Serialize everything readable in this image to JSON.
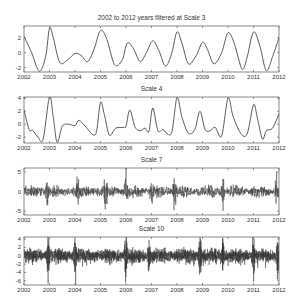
{
  "figure": {
    "width": 301,
    "height": 306,
    "line_color": "#333333",
    "axes_color": "#555555",
    "background": "#ffffff"
  },
  "chart_data": [
    {
      "type": "line",
      "title": "2002 to 2012 years filtered at Scale 3",
      "xlabel": "",
      "ylabel": "",
      "xlim": [
        2002,
        2012
      ],
      "ylim": [
        -2.6,
        3.6
      ],
      "xticks": [
        "2002",
        "2003",
        "2004",
        "2005",
        "2006",
        "2007",
        "2008",
        "2009",
        "2010",
        "2011",
        "2012"
      ],
      "yticks": [
        -2,
        0,
        2
      ],
      "box": {
        "x": 24,
        "y": 26,
        "w": 255,
        "h": 46
      },
      "title_y": 20,
      "style": "smooth",
      "series": [
        {
          "name": "Scale 3",
          "x": [
            2002.0,
            2002.3,
            2002.6,
            2002.85,
            2003.0,
            2003.15,
            2003.4,
            2003.7,
            2004.0,
            2004.25,
            2004.5,
            2004.75,
            2005.0,
            2005.25,
            2005.55,
            2005.85,
            2006.05,
            2006.3,
            2006.55,
            2006.8,
            2007.05,
            2007.3,
            2007.55,
            2007.8,
            2008.0,
            2008.2,
            2008.45,
            2008.75,
            2009.0,
            2009.2,
            2009.45,
            2009.75,
            2010.0,
            2010.25,
            2010.55,
            2010.75,
            2011.0,
            2011.25,
            2011.5,
            2011.75,
            2012.0
          ],
          "values": [
            2.2,
            0.0,
            -2.5,
            -0.5,
            3.3,
            2.0,
            -1.3,
            -1.0,
            -0.1,
            -0.4,
            -1.2,
            0.5,
            3.0,
            1.8,
            -1.6,
            -1.0,
            1.3,
            0.5,
            -1.2,
            0.0,
            1.6,
            0.2,
            -1.8,
            0.0,
            2.8,
            1.2,
            -1.5,
            -0.4,
            1.4,
            0.4,
            -1.5,
            0.0,
            2.7,
            1.2,
            -2.2,
            -0.6,
            2.8,
            0.9,
            -2.4,
            -0.5,
            2.0
          ]
        }
      ]
    },
    {
      "type": "line",
      "title": "Scale 4",
      "xlabel": "",
      "ylabel": "",
      "xlim": [
        2002,
        2012
      ],
      "ylim": [
        -2.9,
        4.2
      ],
      "xticks": [
        "2002",
        "2003",
        "2004",
        "2005",
        "2006",
        "2007",
        "2008",
        "2009",
        "2010",
        "2011",
        "2012"
      ],
      "yticks": [
        -2,
        0,
        2,
        4
      ],
      "box": {
        "x": 24,
        "y": 97,
        "w": 255,
        "h": 46
      },
      "title_y": 91,
      "style": "smooth",
      "series": [
        {
          "name": "Scale 4",
          "x": [
            2002.0,
            2002.2,
            2002.35,
            2002.55,
            2002.75,
            2003.0,
            2003.15,
            2003.3,
            2003.5,
            2003.75,
            2004.0,
            2004.15,
            2004.4,
            2004.7,
            2004.85,
            2005.0,
            2005.15,
            2005.35,
            2005.6,
            2005.9,
            2006.0,
            2006.15,
            2006.35,
            2006.55,
            2006.75,
            2006.9,
            2007.05,
            2007.25,
            2007.45,
            2007.6,
            2007.8,
            2008.0,
            2008.2,
            2008.45,
            2008.7,
            2008.9,
            2009.1,
            2009.3,
            2009.5,
            2009.75,
            2010.0,
            2010.2,
            2010.5,
            2010.75,
            2011.0,
            2011.15,
            2011.35,
            2011.5,
            2011.75,
            2012.0
          ],
          "values": [
            2.2,
            -0.8,
            -1.0,
            -2.0,
            -2.3,
            4.2,
            1.0,
            -2.8,
            -0.3,
            0.0,
            -0.2,
            0.6,
            -0.3,
            -1.6,
            -1.0,
            3.4,
            1.5,
            -1.7,
            -0.6,
            -0.5,
            -0.3,
            2.2,
            -0.4,
            -1.0,
            -0.6,
            -1.1,
            2.5,
            -1.0,
            -0.8,
            -1.4,
            -1.2,
            4.1,
            1.0,
            -1.4,
            -0.8,
            2.0,
            -0.8,
            -1.0,
            -0.5,
            -1.8,
            4.0,
            1.2,
            -1.4,
            -1.5,
            3.0,
            1.0,
            -2.3,
            -1.0,
            -0.6,
            1.6
          ]
        }
      ]
    },
    {
      "type": "line",
      "title": "Scale 7",
      "xlabel": "",
      "ylabel": "",
      "xlim": [
        2002,
        2012
      ],
      "ylim": [
        -6,
        6
      ],
      "xticks": [
        "2002",
        "2003",
        "2004",
        "2005",
        "2006",
        "2007",
        "2008",
        "2009",
        "2010",
        "2011",
        "2012"
      ],
      "yticks": [
        -5,
        0,
        5
      ],
      "box": {
        "x": 24,
        "y": 168,
        "w": 255,
        "h": 47
      },
      "title_y": 162,
      "style": "noise",
      "noise": {
        "points": 1300,
        "base_amp": 1.1,
        "burst_amp": 4.5,
        "seed": 7,
        "spikes": [
          2002.9,
          2004.1,
          2005.2,
          2006.0,
          2007.0,
          2007.9,
          2009.8,
          2011.9
        ]
      },
      "series": [
        {
          "name": "Scale 7",
          "description": "high-frequency oscillation around 0, amplitude mostly within ±3, bursts to ±5"
        }
      ]
    },
    {
      "type": "line",
      "title": "Scale 10",
      "xlabel": "",
      "ylabel": "",
      "xlim": [
        2002,
        2012
      ],
      "ylim": [
        -7,
        4.5
      ],
      "xticks": [
        "2002",
        "2003",
        "2004",
        "2005",
        "2006",
        "2007",
        "2008",
        "2009",
        "2010",
        "2011",
        "2012"
      ],
      "yticks": [
        -6,
        -4,
        -2,
        0,
        2,
        4
      ],
      "box": {
        "x": 24,
        "y": 237,
        "w": 255,
        "h": 48
      },
      "title_y": 231,
      "style": "noise",
      "noise": {
        "points": 2600,
        "base_amp": 1.3,
        "burst_amp": 4.5,
        "seed": 10,
        "neg_bias": true,
        "spikes": [
          2002.95,
          2004.0,
          2006.0,
          2006.9,
          2008.9,
          2009.8,
          2011.0,
          2011.95
        ]
      },
      "series": [
        {
          "name": "Scale 10",
          "description": "dense noise around 0, mostly within ±2, negative spikes down to -6"
        }
      ]
    }
  ]
}
